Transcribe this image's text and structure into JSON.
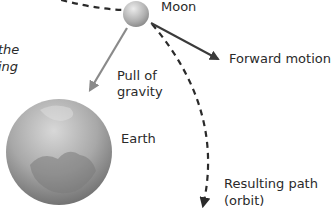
{
  "diagram": {
    "labels": {
      "moon": "Moon",
      "forward_motion": "Forward motion",
      "gravity_line1": "Pull of",
      "gravity_line2": "gravity",
      "earth": "Earth",
      "path_line1": "Resulting path",
      "path_line2": "(orbit)",
      "cropped_line1": "the",
      "cropped_line2": "ing"
    },
    "colors": {
      "gravity_arrow": "#8a8a8a",
      "forward_arrow": "#3a3a3a",
      "orbit_dashes": "#2a2a2a",
      "earth_light": "#cfcfcf",
      "earth_dark": "#6e6e6e",
      "moon_light": "#e6e6e6",
      "moon_dark": "#8c8c8c"
    },
    "icons": {
      "moon": "moon-sphere",
      "earth": "earth-globe"
    }
  }
}
